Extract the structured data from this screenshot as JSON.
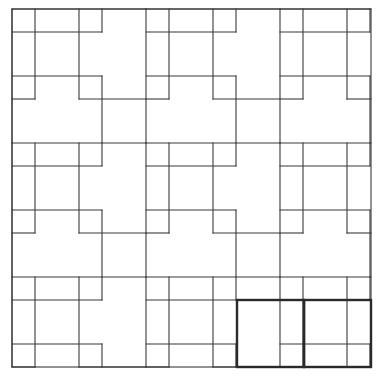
{
  "diagram": {
    "colors": {
      "background": "#ffffff",
      "line": "#3a3a3a",
      "highlight": "#2a2a2a"
    },
    "origin": [
      12,
      9
    ],
    "size": 359,
    "period": 134,
    "motif": {
      "horizontal": [
        {
          "y": 0,
          "x0": 0,
          "x1": 134
        },
        {
          "y": 23,
          "x0": 0,
          "x1": 90
        },
        {
          "y": 67,
          "x0": 0,
          "x1": 90
        },
        {
          "y": 90,
          "x0": 0,
          "x1": 23
        },
        {
          "y": 90,
          "x0": 67,
          "x1": 134
        }
      ],
      "vertical": [
        {
          "x": 0,
          "y0": 0,
          "y1": 134
        },
        {
          "x": 23,
          "y0": 0,
          "y1": 90
        },
        {
          "x": 67,
          "y0": 0,
          "y1": 90
        },
        {
          "x": 90,
          "y0": 0,
          "y1": 23
        },
        {
          "x": 90,
          "y0": 67,
          "y1": 134
        }
      ]
    },
    "highlighted_squares": [
      {
        "x": 237,
        "y": 300,
        "w": 67,
        "h": 67
      },
      {
        "x": 304,
        "y": 300,
        "w": 67,
        "h": 67
      }
    ]
  }
}
